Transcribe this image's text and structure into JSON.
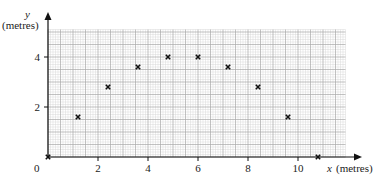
{
  "chart_data": {
    "type": "scatter",
    "title": "",
    "xlabel": "x (metres)",
    "ylabel": "y (metres)",
    "xlabel_var": "x",
    "xlabel_unit": "(metres)",
    "ylabel_var": "y",
    "ylabel_unit": "(metres)",
    "xlim": [
      0,
      11.9
    ],
    "ylim": [
      0,
      5.1
    ],
    "xticks": [
      0,
      2,
      4,
      6,
      8,
      10
    ],
    "yticks": [
      2,
      4
    ],
    "origin_label": "0",
    "grid": true,
    "grid_minor_step": 0.1,
    "grid_major_step": 0.5,
    "marker": "x",
    "points": [
      {
        "x": 0,
        "y": 0
      },
      {
        "x": 1.2,
        "y": 1.6
      },
      {
        "x": 2.4,
        "y": 2.8
      },
      {
        "x": 3.6,
        "y": 3.6
      },
      {
        "x": 4.8,
        "y": 4.0
      },
      {
        "x": 6.0,
        "y": 4.0
      },
      {
        "x": 7.2,
        "y": 3.6
      },
      {
        "x": 8.4,
        "y": 2.8
      },
      {
        "x": 9.6,
        "y": 1.6
      },
      {
        "x": 10.8,
        "y": 0
      }
    ],
    "legend": null
  },
  "layout": {
    "origin_px": [
      48,
      157
    ],
    "px_per_unit": 25,
    "x_axis_end_px": 362,
    "y_axis_top_px": 12
  },
  "colors": {
    "axis": "#111111",
    "grid_minor": "#d9d9d9",
    "grid_major": "#a8a8a8",
    "marker": "#111111"
  }
}
